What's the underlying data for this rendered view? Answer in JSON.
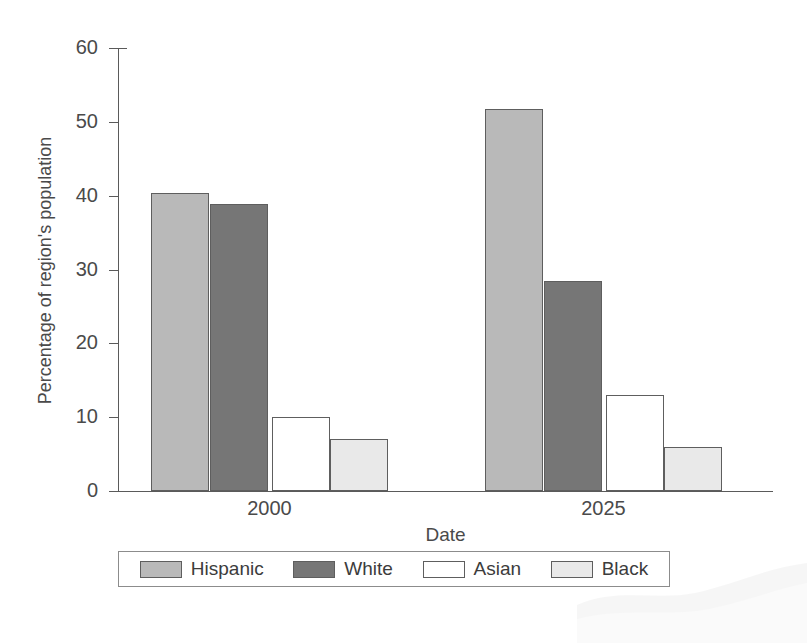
{
  "chart_data": {
    "type": "bar",
    "title": "",
    "xlabel": "Date",
    "ylabel": "Percentage of region's population",
    "categories": [
      "2000",
      "2025"
    ],
    "series": [
      {
        "name": "Hispanic",
        "values": [
          40.4,
          51.7
        ],
        "color": "#b9b9b9"
      },
      {
        "name": "White",
        "values": [
          38.9,
          28.4
        ],
        "color": "#767676"
      },
      {
        "name": "Asian",
        "values": [
          10.0,
          13.0
        ],
        "color": "#ffffff"
      },
      {
        "name": "Black",
        "values": [
          7.1,
          5.9
        ],
        "color": "#e9e9e9"
      }
    ],
    "ylim": [
      0,
      60
    ],
    "yticks": [
      0,
      10,
      20,
      30,
      40,
      50,
      60
    ],
    "ytick_labels": [
      "0",
      "10",
      "20",
      "30",
      "40",
      "50",
      "60"
    ],
    "grid": false,
    "legend_position": "bottom",
    "legend_entries": [
      "Hispanic",
      "White",
      "Asian",
      "Black"
    ],
    "axis_color": "#5a5a5a",
    "bar_edge_color": "#5e5e5e"
  }
}
